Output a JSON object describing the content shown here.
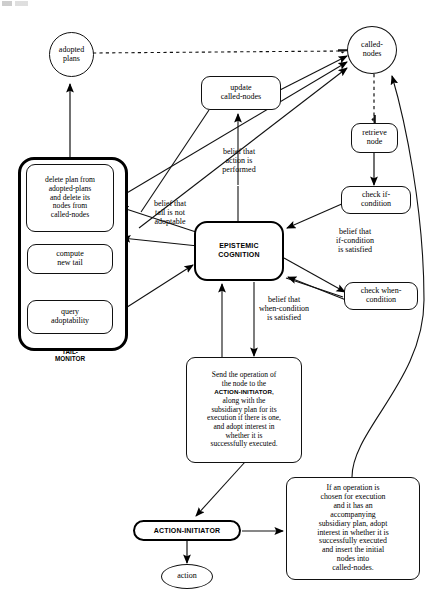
{
  "diagram": {
    "colors": {
      "stroke": "#111111",
      "heavy_stroke": "#000000",
      "background": "#ffffff"
    }
  },
  "nodes": {
    "adopted_plans": {
      "label": "adopted\nplans",
      "shape": "ellipse"
    },
    "called_nodes": {
      "label": "called-\nnodes",
      "shape": "ellipse"
    },
    "update_called_nodes": {
      "label": "update\ncalled-nodes",
      "shape": "rounded-rect"
    },
    "retrieve_node": {
      "label": "retrieve\nnode",
      "shape": "rounded-rect"
    },
    "check_if_condition": {
      "label": "check if-\ncondition",
      "shape": "rounded-rect"
    },
    "check_when_condition": {
      "label": "check when-\ncondition",
      "shape": "rounded-rect"
    },
    "epistemic_cognition": {
      "label": "EPISTEMIC\nCOGNITION",
      "shape": "heavy-rounded-rect"
    },
    "delete_plan": {
      "label": "delete plan from\nadopted-plans\nand delete its\nnodes from\ncalled-nodes",
      "shape": "rounded-rect"
    },
    "compute_new_tail": {
      "label": "compute\nnew tail",
      "shape": "rounded-rect"
    },
    "query_adoptability": {
      "label": "query\nadoptability",
      "shape": "rounded-rect"
    },
    "send_operation": {
      "label": "Send the operation of\nthe node to the\nACTION-INITIATOR,\nalong with the\nsubsidiary plan for its\nexecution if there is one,\nand adopt interest in\nwhether it is\nsuccessfully executed.",
      "shape": "rounded-rect"
    },
    "if_operation_chosen": {
      "label": "If an operation is\nchosen for execution\nand it has an\naccompanying\nsubsidiary plan, adopt\ninterest in whether it is\nsuccessfully executed\nand insert the initial\nnodes into\ncalled-nodes.",
      "shape": "rounded-rect"
    },
    "action_initiator": {
      "label": "ACTION-INITIATOR",
      "shape": "heavy-pill"
    },
    "action": {
      "label": "action",
      "shape": "ellipse"
    }
  },
  "groups": {
    "tail_monitor": {
      "caption": "TAIL-\nMONITOR"
    }
  },
  "edge_labels": {
    "belief_action_performed": "belief that\naction is\nperformed",
    "belief_tail_not_adoptable": "belief that\ntail is not\nadoptable",
    "belief_if_condition_satisfied": "belief that\nif-condition\nis satisfied",
    "belief_when_condition_satisfied": "belief that\nwhen-condition\nis satisfied"
  },
  "send_operation_parts": {
    "line1": "Send the operation of",
    "line2": "the node to the",
    "line3": "ACTION-INITIATOR,",
    "line4": "along with the",
    "line5": "subsidiary plan for its",
    "line6": "execution if there is one,",
    "line7": "and adopt interest in",
    "line8": "whether it is",
    "line9": "successfully executed."
  }
}
